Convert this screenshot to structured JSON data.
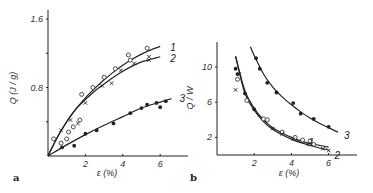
{
  "chart_data": [
    {
      "panel": "a",
      "type": "scatter",
      "title": "",
      "xlabel": "ε (%)",
      "ylabel": "Q (J / g)",
      "xticks": [
        "2",
        "4",
        "6"
      ],
      "yticks": [
        "0.8",
        "1.6"
      ],
      "xlim": [
        0,
        7.5
      ],
      "ylim": [
        0,
        1.7
      ],
      "grid": false,
      "legend": "inline curve numbers at right end",
      "series": [
        {
          "name": "1",
          "marker": "open-circle",
          "points": [
            [
              0.3,
              0.2
            ],
            [
              0.7,
              0.15
            ],
            [
              1.0,
              0.2
            ],
            [
              1.1,
              0.28
            ],
            [
              1.35,
              0.34
            ],
            [
              1.7,
              0.42
            ],
            [
              1.8,
              0.72
            ],
            [
              2.4,
              0.8
            ],
            [
              3.0,
              0.92
            ],
            [
              3.6,
              1.02
            ],
            [
              4.3,
              1.18
            ],
            [
              4.4,
              1.12
            ],
            [
              5.3,
              1.26
            ]
          ],
          "fit": [
            [
              0,
              0
            ],
            [
              0.5,
              0.22
            ],
            [
              1,
              0.4
            ],
            [
              1.5,
              0.55
            ],
            [
              2,
              0.68
            ],
            [
              2.5,
              0.79
            ],
            [
              3,
              0.89
            ],
            [
              3.5,
              0.98
            ],
            [
              4,
              1.06
            ],
            [
              4.5,
              1.13
            ],
            [
              5,
              1.19
            ],
            [
              5.5,
              1.24
            ],
            [
              6,
              1.28
            ]
          ]
        },
        {
          "name": "2",
          "marker": "cross",
          "points": [
            [
              0.7,
              0.3
            ],
            [
              1.2,
              0.42
            ],
            [
              1.6,
              0.38
            ],
            [
              2.0,
              0.62
            ],
            [
              2.9,
              0.82
            ],
            [
              3.4,
              0.85
            ],
            [
              3.9,
              1.0
            ],
            [
              4.6,
              1.08
            ],
            [
              5.4,
              1.16
            ],
            [
              5.4,
              1.12
            ]
          ],
          "fit": [
            [
              0,
              0
            ],
            [
              0.5,
              0.22
            ],
            [
              1,
              0.4
            ],
            [
              1.5,
              0.55
            ],
            [
              2,
              0.66
            ],
            [
              2.5,
              0.76
            ],
            [
              3,
              0.84
            ],
            [
              3.5,
              0.92
            ],
            [
              4,
              0.99
            ],
            [
              4.5,
              1.05
            ],
            [
              5,
              1.1
            ],
            [
              5.5,
              1.13
            ],
            [
              6,
              1.16
            ]
          ]
        },
        {
          "name": "3",
          "marker": "filled-circle",
          "points": [
            [
              0.75,
              0.1
            ],
            [
              1.4,
              0.12
            ],
            [
              2.0,
              0.26
            ],
            [
              2.6,
              0.3
            ],
            [
              3.5,
              0.38
            ],
            [
              4.4,
              0.5
            ],
            [
              5.0,
              0.56
            ],
            [
              5.3,
              0.6
            ],
            [
              5.8,
              0.62
            ],
            [
              6.0,
              0.57
            ],
            [
              6.3,
              0.64
            ]
          ],
          "fit": [
            [
              0,
              0
            ],
            [
              1,
              0.13
            ],
            [
              2,
              0.25
            ],
            [
              3,
              0.36
            ],
            [
              4,
              0.46
            ],
            [
              5,
              0.56
            ],
            [
              6,
              0.63
            ],
            [
              6.6,
              0.67
            ]
          ]
        }
      ]
    },
    {
      "panel": "b",
      "type": "scatter",
      "title": "",
      "xlabel": "ε (%)",
      "ylabel": "Q / W",
      "xticks": [
        "2",
        "4",
        "6"
      ],
      "yticks": [
        "2",
        "6",
        "10"
      ],
      "xlim": [
        0,
        7.5
      ],
      "ylim": [
        0,
        13
      ],
      "grid": false,
      "legend": "inline curve numbers at right end",
      "series": [
        {
          "name": "1",
          "marker": "open-circle",
          "points": [
            [
              1.1,
              8.6
            ],
            [
              1.6,
              6.2
            ],
            [
              2.5,
              4.1
            ],
            [
              2.7,
              4.0
            ],
            [
              3.5,
              2.6
            ],
            [
              4.2,
              2.0
            ],
            [
              4.6,
              1.7
            ],
            [
              5.0,
              1.6
            ],
            [
              5.2,
              1.2
            ]
          ],
          "fit": [
            [
              1.0,
              11.2
            ],
            [
              1.5,
              7.3
            ],
            [
              2,
              5.3
            ],
            [
              2.5,
              4.0
            ],
            [
              3,
              3.1
            ],
            [
              3.5,
              2.5
            ],
            [
              4,
              2.0
            ],
            [
              4.5,
              1.6
            ],
            [
              5,
              1.3
            ],
            [
              5.5,
              1.1
            ],
            [
              6,
              0.9
            ]
          ]
        },
        {
          "name": "2",
          "marker": "cross",
          "points": [
            [
              1.0,
              7.4
            ],
            [
              1.2,
              9.2
            ],
            [
              3.0,
              3.0
            ],
            [
              3.5,
              2.4
            ],
            [
              4.1,
              1.8
            ],
            [
              4.9,
              1.2
            ],
            [
              5.7,
              0.7
            ],
            [
              6.0,
              0.5
            ]
          ],
          "fit": [
            [
              1.0,
              11.2
            ],
            [
              1.5,
              7.0
            ],
            [
              2,
              5.1
            ],
            [
              2.5,
              3.8
            ],
            [
              3,
              2.9
            ],
            [
              3.5,
              2.3
            ],
            [
              4,
              1.8
            ],
            [
              4.5,
              1.4
            ],
            [
              5,
              1.1
            ],
            [
              5.5,
              0.8
            ],
            [
              6,
              0.6
            ]
          ]
        },
        {
          "name": "3",
          "marker": "filled-circle",
          "points": [
            [
              1.0,
              9.8
            ],
            [
              1.1,
              9.2
            ],
            [
              1.5,
              7.0
            ],
            [
              2.0,
              5.2
            ],
            [
              2.1,
              11.0
            ],
            [
              2.3,
              9.8
            ],
            [
              2.7,
              8.2
            ],
            [
              3.2,
              7.1
            ],
            [
              4.1,
              5.9
            ],
            [
              4.5,
              4.7
            ],
            [
              5.2,
              4.1
            ],
            [
              6.0,
              3.2
            ]
          ],
          "fit": [
            [
              1.8,
              12.3
            ],
            [
              2,
              11.3
            ],
            [
              2.5,
              9.2
            ],
            [
              3,
              7.7
            ],
            [
              3.5,
              6.6
            ],
            [
              4,
              5.7
            ],
            [
              4.5,
              4.9
            ],
            [
              5,
              4.2
            ],
            [
              5.5,
              3.6
            ],
            [
              6,
              3.1
            ],
            [
              6.5,
              2.6
            ]
          ]
        }
      ]
    }
  ],
  "panels": {
    "a": {
      "letter": "a",
      "xlabel": "ε (%)",
      "ylabel": "Q (J / g)",
      "xticks": [
        "2",
        "4",
        "6"
      ],
      "yticks": [
        "0.8",
        "1.6"
      ],
      "curve_labels": [
        "1",
        "2",
        "3"
      ]
    },
    "b": {
      "letter": "b",
      "xlabel": "ε (%)",
      "ylabel": "Q / W",
      "xticks": [
        "2",
        "4",
        "6"
      ],
      "yticks": [
        "10",
        "6",
        "2"
      ],
      "curve_labels": [
        "1",
        "2",
        "3"
      ]
    }
  }
}
